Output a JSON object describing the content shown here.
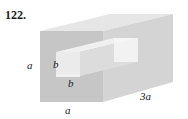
{
  "problem": {
    "number": "122.",
    "labels": {
      "height": "a",
      "hole_width": "b",
      "hole_height": "b",
      "width": "a",
      "length": "3a"
    }
  },
  "colors": {
    "front_face": "#c8c8c8",
    "top_face": "#e4e4e4",
    "right_face": "#d6d6d6",
    "hole": "#f2f2f2"
  }
}
